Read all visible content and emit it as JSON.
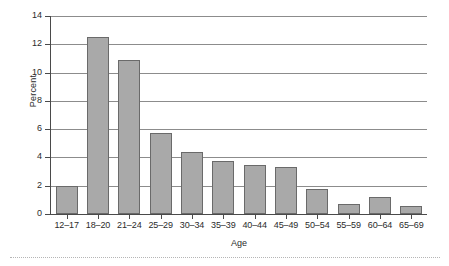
{
  "chart_data": {
    "type": "bar",
    "title": "",
    "subtitle": "",
    "xlabel": "Age",
    "ylabel": "Percent",
    "categories": [
      "12–17",
      "18–20",
      "21–24",
      "25–29",
      "30–34",
      "35–39",
      "40–44",
      "45–49",
      "50–54",
      "55–59",
      "60–64",
      "65–69"
    ],
    "values": [
      2.0,
      12.5,
      10.9,
      5.7,
      4.35,
      3.75,
      3.45,
      3.35,
      1.75,
      0.7,
      1.2,
      0.55
    ],
    "ylim": [
      0,
      14
    ],
    "ytick_labels": [
      "0",
      "2",
      "4",
      "6",
      "8",
      "10",
      "12",
      "14"
    ],
    "ytick_values": [
      0,
      2,
      4,
      6,
      8,
      10,
      12,
      14
    ],
    "grid": "horizontal",
    "legend": "none",
    "bar_color": "#a9a9a9",
    "bar_edge_color": "#6a6a6a",
    "axis_color": "#4a4a4a",
    "gridline_color": "#8c8c8c",
    "background": "#ffffff"
  }
}
